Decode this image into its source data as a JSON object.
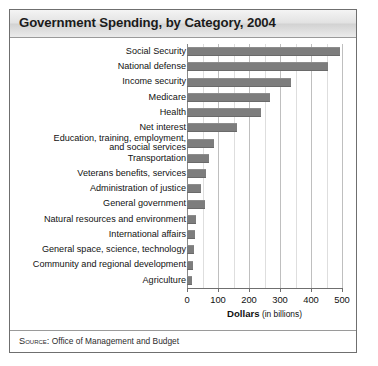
{
  "figure": {
    "title": "Government Spending, by Category, 2004",
    "source_label": "Source:",
    "source_text": " Office of Management and Budget"
  },
  "axis": {
    "title_bold": "Dollars",
    "title_sub": " (in billions)"
  },
  "colors": {
    "bar": "#7d7d7d",
    "grid": "#bfbfbf",
    "grid_minor": "#dedede",
    "frame": "#6f6f6f",
    "title_band": "#e2e2e2",
    "text": "#111111"
  },
  "chart_data": {
    "type": "bar",
    "orientation": "horizontal",
    "title": "Government Spending, by Category, 2004",
    "xlabel": "Dollars (in billions)",
    "ylabel": "",
    "xlim": [
      0,
      500
    ],
    "xticks": [
      0,
      100,
      200,
      300,
      400,
      500
    ],
    "xtick_labels": [
      "0",
      "100",
      "200",
      "300",
      "400",
      "500"
    ],
    "minor_tick_step": 50,
    "grid": true,
    "legend": false,
    "source": "SOURCE: Office of Management and Budget",
    "categories": [
      "Social Security",
      "National defense",
      "Income security",
      "Medicare",
      "Health",
      "Net interest",
      "Education, training, employment,\nand social services",
      "Transportation",
      "Veterans benefits, services",
      "Administration of justice",
      "General government",
      "Natural resources and environment",
      "International affairs",
      "General space, science, technology",
      "Community and regional development",
      "Agriculture"
    ],
    "values": [
      495,
      455,
      335,
      267,
      238,
      160,
      88,
      70,
      60,
      45,
      57,
      30,
      27,
      23,
      19,
      17
    ]
  }
}
